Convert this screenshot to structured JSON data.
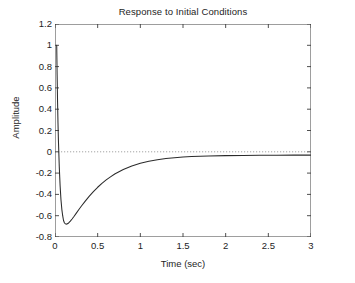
{
  "figure": {
    "background_color": "#ffffff",
    "axes_color": "#3c3c3c",
    "curve_color": "#2b2b2b",
    "zeroline_color": "#8c8c8c"
  },
  "chart_data": {
    "type": "line",
    "title": "Response to Initial Conditions",
    "xlabel": "Time (sec)",
    "ylabel": "Amplitude",
    "xlim": [
      0,
      3
    ],
    "ylim": [
      -0.8,
      1.2
    ],
    "grid": false,
    "legend": null,
    "xticks": [
      0,
      0.5,
      1,
      1.5,
      2,
      2.5,
      3
    ],
    "xtick_labels": [
      "0",
      "0.5",
      "1",
      "1.5",
      "2",
      "2.5",
      "3"
    ],
    "yticks": [
      1.2,
      1,
      0.8,
      0.6,
      0.4,
      0.2,
      0,
      -0.2,
      -0.4,
      -0.6,
      -0.8
    ],
    "ytick_labels": [
      "1.2",
      "1",
      "0.8",
      "0.6",
      "0.4",
      "0.2",
      "0",
      "-0.2",
      "-0.4",
      "-0.6",
      "-0.8"
    ],
    "annotations": [
      {
        "name": "zero-reference-line",
        "type": "hline",
        "y": 0,
        "style": "dotted"
      }
    ],
    "series": [
      {
        "name": "initial-condition-response",
        "style": "solid",
        "x": [
          0.02,
          0.025,
          0.03,
          0.035,
          0.04,
          0.05,
          0.06,
          0.07,
          0.08,
          0.09,
          0.1,
          0.11,
          0.12,
          0.13,
          0.14,
          0.16,
          0.18,
          0.2,
          0.22,
          0.25,
          0.28,
          0.31,
          0.35,
          0.4,
          0.45,
          0.5,
          0.55,
          0.6,
          0.65,
          0.7,
          0.8,
          0.9,
          1.0,
          1.1,
          1.2,
          1.3,
          1.4,
          1.5,
          1.6,
          1.7,
          1.8,
          2.0,
          2.2,
          2.4,
          2.6,
          2.8,
          3.0
        ],
        "y": [
          1.0,
          0.72,
          0.47,
          0.27,
          0.11,
          -0.14,
          -0.32,
          -0.45,
          -0.54,
          -0.6,
          -0.645,
          -0.666,
          -0.676,
          -0.679,
          -0.678,
          -0.668,
          -0.651,
          -0.631,
          -0.61,
          -0.576,
          -0.542,
          -0.509,
          -0.468,
          -0.419,
          -0.374,
          -0.333,
          -0.296,
          -0.264,
          -0.235,
          -0.209,
          -0.166,
          -0.133,
          -0.107,
          -0.088,
          -0.074,
          -0.063,
          -0.055,
          -0.049,
          -0.045,
          -0.042,
          -0.04,
          -0.036,
          -0.034,
          -0.033,
          -0.032,
          -0.031,
          -0.031
        ]
      }
    ]
  }
}
